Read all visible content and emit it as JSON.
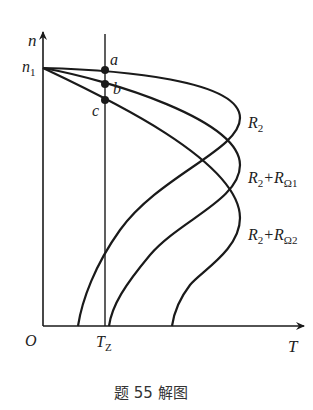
{
  "diagram": {
    "axes": {
      "y_label": "n",
      "x_label": "T",
      "origin_label": "O",
      "y_tick_label": "n",
      "y_tick_sub": "1",
      "x_tick_label": "T",
      "x_tick_sub": "Z"
    },
    "points": [
      {
        "label": "a"
      },
      {
        "label": "b"
      },
      {
        "label": "c"
      }
    ],
    "curves": [
      {
        "main": "R",
        "sub": "2",
        "extra": "",
        "extra_sub": ""
      },
      {
        "main": "R",
        "sub": "2",
        "extra": "+R",
        "extra_sub": "Ω1"
      },
      {
        "main": "R",
        "sub": "2",
        "extra": "+R",
        "extra_sub": "Ω2"
      }
    ],
    "caption": "题 55 解图",
    "colors": {
      "line": "#1a1a1a",
      "text": "#222222"
    }
  }
}
